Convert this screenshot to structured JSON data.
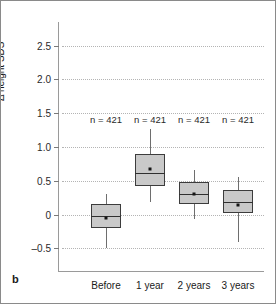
{
  "figure": {
    "panel_letter": "b",
    "background_color": "#ffffff",
    "border_color": "#8a8a8a"
  },
  "chart_data": {
    "type": "box",
    "title": "",
    "subtitle": "",
    "xlabel": "",
    "ylabel": "Δ height SDS",
    "categories": [
      "Before",
      "1 year",
      "2 years",
      "3 years"
    ],
    "ylim": [
      -0.85,
      2.85
    ],
    "yticks": [
      2.5,
      2.0,
      1.5,
      1.0,
      0.5,
      0,
      -0.5
    ],
    "ytick_labels": [
      "2.5",
      "2.0",
      "1.5",
      "1.0",
      "0.5",
      "0",
      "–0.5"
    ],
    "grid": true,
    "grid_style": "dotted",
    "legend": "none",
    "annotations": [
      "n = 421",
      "n = 421",
      "n = 421",
      "n = 421"
    ],
    "annotation_y": 1.42,
    "box_fill_color": "#c9c9c9",
    "box_edge_color": "#3c3c3c",
    "mean_marker_color": "#151515",
    "series": [
      {
        "name": "Before",
        "n_label": "n = 421",
        "whisker_low": -0.5,
        "q1": -0.2,
        "median": -0.02,
        "q3": 0.15,
        "whisker_high": 0.3,
        "mean": -0.05
      },
      {
        "name": "1 year",
        "n_label": "n = 421",
        "whisker_low": 0.19,
        "q1": 0.42,
        "median": 0.62,
        "q3": 0.89,
        "whisker_high": 1.27,
        "mean": 0.68
      },
      {
        "name": "2 years",
        "n_label": "n = 421",
        "whisker_low": -0.06,
        "q1": 0.15,
        "median": 0.3,
        "q3": 0.48,
        "whisker_high": 0.66,
        "mean": 0.31
      },
      {
        "name": "3 years",
        "n_label": "n = 421",
        "whisker_low": -0.41,
        "q1": 0.03,
        "median": 0.19,
        "q3": 0.37,
        "whisker_high": 0.56,
        "mean": 0.14
      }
    ]
  }
}
